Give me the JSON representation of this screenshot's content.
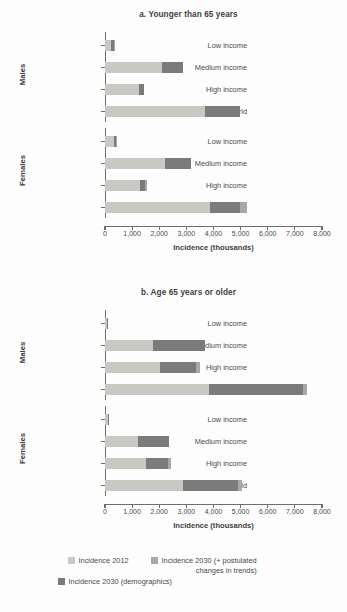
{
  "chart_data": {
    "type": "bar",
    "orientation": "horizontal",
    "stacked": true,
    "xlabel": "Incidence (thousands)",
    "ylabel": "",
    "xlim": [
      0,
      8000
    ],
    "grid": false,
    "legend_position": "bottom",
    "xticks": [
      "0",
      "1,000",
      "2,000",
      "3,000",
      "4,000",
      "5,000",
      "6,000",
      "7,000",
      "8,000"
    ],
    "xtick_values": [
      0,
      1000,
      2000,
      3000,
      4000,
      5000,
      6000,
      7000,
      8000
    ],
    "series": [
      {
        "name": "Incidence 2012",
        "color": "#c9c9c4"
      },
      {
        "name": "Incidence 2030 (demographics)",
        "color": "#7b7b7b"
      },
      {
        "name": "Incidence 2030 (+ postulated changes in trends)",
        "color": "#a8a8a4"
      }
    ],
    "panels": [
      {
        "title": "a. Younger than 65 years",
        "groups": [
          {
            "label": "Males",
            "categories": [
              "Low income",
              "Medium income",
              "High income",
              "World"
            ],
            "values": {
              "Incidence 2012": [
                210,
                2100,
                1250,
                3680
              ],
              "Incidence 2030 (demographics)": [
                110,
                780,
                200,
                1290
              ],
              "Incidence 2030 (+ postulated changes in trends)": [
                30,
                0,
                0,
                0
              ]
            }
          },
          {
            "label": "Females",
            "categories": [
              "Low income",
              "Medium income",
              "High income",
              "World"
            ],
            "values": {
              "Incidence 2012": [
                330,
                2210,
                1290,
                3860
              ],
              "Incidence 2030 (demographics)": [
                80,
                960,
                180,
                1130
              ],
              "Incidence 2030 (+ postulated changes in trends)": [
                40,
                0,
                80,
                230
              ]
            }
          }
        ]
      },
      {
        "title": "b. Age 65 years or older",
        "groups": [
          {
            "label": "Males",
            "categories": [
              "Low income",
              "Medium income",
              "High income",
              "World"
            ],
            "values": {
              "Incidence 2012": [
                70,
                1770,
                2020,
                3830
              ],
              "Incidence 2030 (demographics)": [
                50,
                1910,
                1330,
                3480
              ],
              "Incidence 2030 (+ postulated changes in trends)": [
                0,
                0,
                140,
                140
              ]
            }
          },
          {
            "label": "Females",
            "categories": [
              "Low income",
              "Medium income",
              "High income",
              "World"
            ],
            "values": {
              "Incidence 2012": [
                100,
                1220,
                1510,
                2880
              ],
              "Incidence 2030 (demographics)": [
                40,
                1150,
                810,
                2020
              ],
              "Incidence 2030 (+ postulated changes in trends)": [
                0,
                0,
                100,
                150
              ]
            }
          }
        ]
      }
    ]
  },
  "legend": {
    "items": [
      {
        "label": "Incidence 2012",
        "color": "#c9c9c4"
      },
      {
        "label": "Incidence 2030 (+ postulated",
        "label2": "changes in trends)",
        "color": "#a8a8a4"
      },
      {
        "label": "Incidence 2030 (demographics)",
        "color": "#7b7b7b"
      }
    ]
  }
}
